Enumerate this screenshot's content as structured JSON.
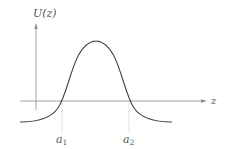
{
  "diagram": {
    "y_axis_label": "U(z)",
    "x_axis_label": "z",
    "markers": [
      {
        "label": "a",
        "sub": "1"
      },
      {
        "label": "a",
        "sub": "2"
      }
    ],
    "colors": {
      "axis": "#8a8a8a",
      "curve": "#444444",
      "guide": "#9a9a9a",
      "text": "#555555"
    }
  }
}
